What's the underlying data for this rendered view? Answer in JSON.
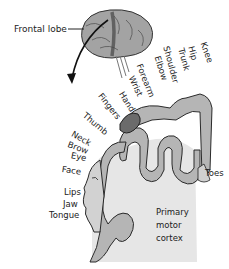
{
  "diagram": {
    "type": "labeled anatomical illustration",
    "top_clipped_text": "",
    "labels": {
      "frontal_lobe": "Frontal lobe",
      "region": [
        "Primary",
        "motor",
        "cortex"
      ],
      "body_parts": {
        "knee": "Knee",
        "hip": "Hip",
        "trunk": "Trunk",
        "shoulder": "Shoulder",
        "elbow": "Elbow",
        "forearm": "Forearm",
        "wrist": "Wrist",
        "hand": "Hand",
        "fingers": "Fingers",
        "thumb": "Thumb",
        "neck": "Neck",
        "brow": "Brow",
        "eye": "Eye",
        "face": "Face",
        "lips": "Lips",
        "jaw": "Jaw",
        "tongue": "Tongue",
        "toes": "Toes"
      }
    },
    "colors": {
      "cortex_fill": "#e6e6e6",
      "gyrus_fill": "#b5b5b5",
      "outline": "#2a2a2a",
      "brain_fill": "#9a9a9a",
      "motor_strip": "#5c5c5c"
    }
  }
}
